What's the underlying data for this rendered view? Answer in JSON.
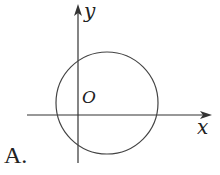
{
  "diagram": {
    "option_label": "A.",
    "axes": {
      "x_label": "x",
      "y_label": "y",
      "origin_label": "O"
    },
    "shape": "circle",
    "colors": {
      "stroke": "#333333",
      "background": "#ffffff"
    }
  }
}
